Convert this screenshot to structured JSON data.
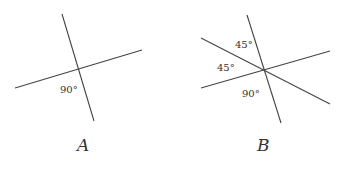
{
  "figures": [
    {
      "id": "A",
      "label": "A",
      "angles": [
        {
          "text": "90°"
        }
      ]
    },
    {
      "id": "B",
      "label": "B",
      "angles": [
        {
          "text": "45°"
        },
        {
          "text": "45°"
        },
        {
          "text": "90°"
        }
      ]
    }
  ],
  "colors": {
    "line": "#444444",
    "text": "#333333",
    "background": "#ffffff"
  }
}
